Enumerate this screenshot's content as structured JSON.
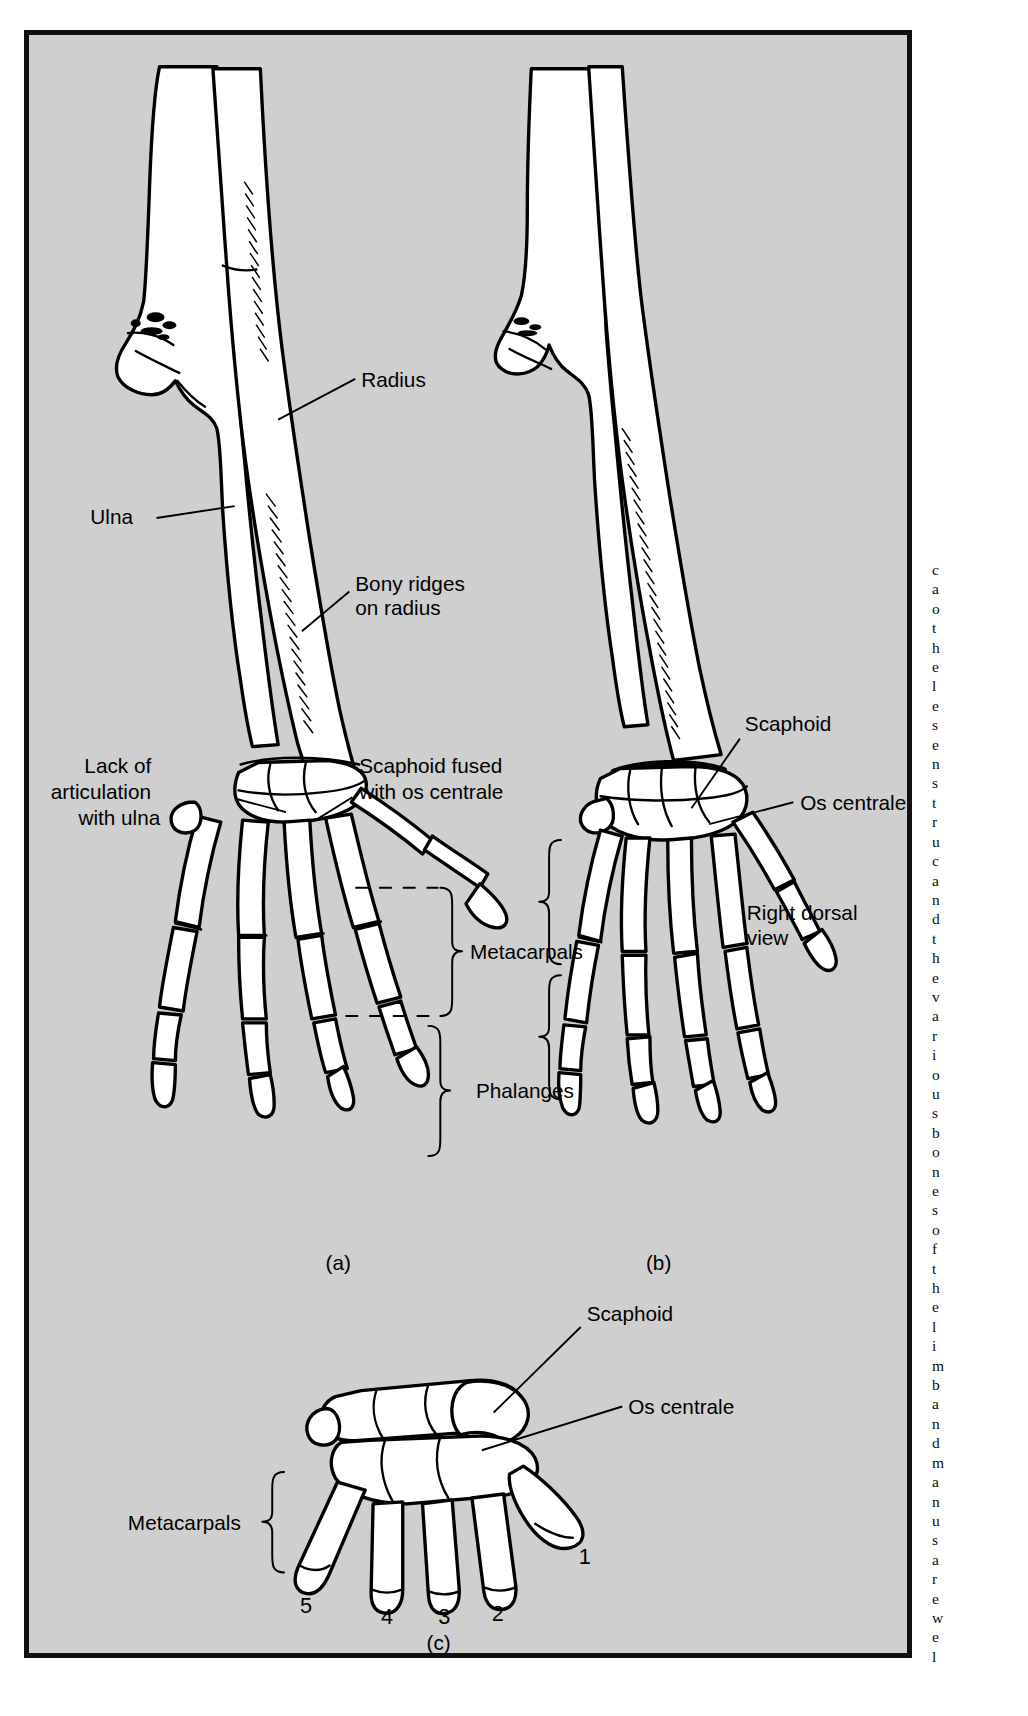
{
  "figure": {
    "background_color": "#cfcfcf",
    "border_color": "#111111",
    "bone_fill": "#ffffff",
    "panels": [
      {
        "id": "a",
        "label": "(a)"
      },
      {
        "id": "b",
        "label": "(b)"
      },
      {
        "id": "c",
        "label": "(c)"
      }
    ]
  },
  "labels": {
    "radius": "Radius",
    "ulna": "Ulna",
    "bony_ridges_line1": "Bony ridges",
    "bony_ridges_line2": "on radius",
    "lack_line1": "Lack of",
    "lack_line2": "articulation",
    "lack_line3": "with ulna",
    "scaphoid_fused_line1": "Scaphoid fused",
    "scaphoid_fused_line2": "with os centrale",
    "metacarpals": "Metacarpals",
    "phalanges": "Phalanges",
    "scaphoid_b": "Scaphoid",
    "os_centrale_b": "Os centrale",
    "right_dorsal_line1": "Right dorsal",
    "right_dorsal_line2": "view",
    "scaphoid_c": "Scaphoid",
    "os_centrale_c": "Os centrale",
    "metacarpals_c": "Metacarpals"
  },
  "digits": {
    "d1": "1",
    "d2": "2",
    "d3": "3",
    "d4": "4",
    "d5": "5"
  },
  "margin_text": {
    "lines": [
      "c",
      "a",
      "o",
      "t",
      "h",
      "e",
      "l",
      "e",
      "s",
      "e",
      "n",
      "s",
      "t",
      "r",
      "u",
      "c",
      "a",
      "n",
      "d",
      "t",
      "h",
      "e",
      "v",
      "a",
      "r",
      "i",
      "o",
      "u",
      "s",
      "b",
      "o",
      "n",
      "e",
      "s",
      "o",
      "f",
      "t",
      "h",
      "e",
      "l",
      "i",
      "m",
      "b",
      "a",
      "n",
      "d",
      "m",
      "a",
      "n",
      "u",
      "s",
      "a",
      "r",
      "e",
      "w",
      "e",
      "l",
      "l"
    ]
  }
}
